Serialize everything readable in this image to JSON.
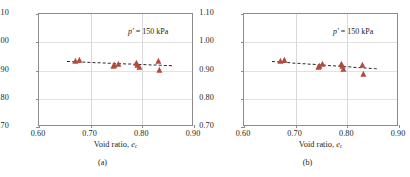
{
  "figure": {
    "marker_color": "#b5493c",
    "trend_color": "#2b2b2b",
    "axis_color": "#8c8c8c",
    "grid_color": "#d9d9d9"
  },
  "panels": [
    {
      "id": "a",
      "caption": "(a)",
      "annotation": "p' = 150 kPa",
      "ylabel_text": "[G0]satur / [G0]D",
      "xlabel_text": "Void ratio, ec",
      "chart_data": {
        "type": "scatter",
        "title": "",
        "xlabel": "Void ratio, e_c",
        "ylabel": "[G_0]_satur / [G_0]_D",
        "xlim": [
          0.6,
          0.9
        ],
        "ylim": [
          0.7,
          1.1
        ],
        "xticks": [
          "0.60",
          "0.70",
          "0.80",
          "0.90"
        ],
        "yticks": [
          "0.70",
          "0.80",
          "0.90",
          "1.00",
          "1.10"
        ],
        "xtick_values": [
          0.6,
          0.7,
          0.8,
          0.9
        ],
        "ytick_values": [
          0.7,
          0.8,
          0.9,
          1.0,
          1.1
        ],
        "grid": true,
        "legend": "none",
        "annotations": [
          {
            "text": "p' = 150 kPa",
            "x": 0.845,
            "y": 1.055
          }
        ],
        "series": [
          {
            "name": "Gmax ratio (saturated / dry)",
            "marker": "triangle",
            "color": "#b5493c",
            "points": [
              {
                "x": 0.672,
                "y": 0.935
              },
              {
                "x": 0.68,
                "y": 0.938
              },
              {
                "x": 0.745,
                "y": 0.915
              },
              {
                "x": 0.748,
                "y": 0.921
              },
              {
                "x": 0.755,
                "y": 0.924
              },
              {
                "x": 0.79,
                "y": 0.928
              },
              {
                "x": 0.792,
                "y": 0.92
              },
              {
                "x": 0.795,
                "y": 0.912
              },
              {
                "x": 0.832,
                "y": 0.933
              },
              {
                "x": 0.834,
                "y": 0.903
              }
            ]
          }
        ],
        "trendline": {
          "style": "dashed",
          "color": "#2b2b2b",
          "x_start": 0.655,
          "y_start": 0.932,
          "x_end": 0.858,
          "y_end": 0.917
        }
      }
    },
    {
      "id": "b",
      "caption": "(b)",
      "annotation": "p' = 150 kPa",
      "ylabel_text": "[G0/F(e)]satur / [G0/F(e)]D",
      "xlabel_text": "Void ratio, ec",
      "chart_data": {
        "type": "scatter",
        "title": "",
        "xlabel": "Void ratio, e_c",
        "ylabel": "[G_0/F(e)]_satur / [G_0/F(e)]_D",
        "xlim": [
          0.6,
          0.9
        ],
        "ylim": [
          0.7,
          1.1
        ],
        "xticks": [
          "0.60",
          "0.70",
          "0.80",
          "0.90"
        ],
        "yticks": [
          "0.70",
          "0.80",
          "0.90",
          "1.00",
          "1.10"
        ],
        "xtick_values": [
          0.6,
          0.7,
          0.8,
          0.9
        ],
        "ytick_values": [
          0.7,
          0.8,
          0.9,
          1.0,
          1.1
        ],
        "grid": true,
        "legend": "none",
        "annotations": [
          {
            "text": "p' = 150 kPa",
            "x": 0.845,
            "y": 1.055
          }
        ],
        "series": [
          {
            "name": "Normalized G0/F(e) ratio (saturated / dry)",
            "marker": "triangle",
            "color": "#b5493c",
            "points": [
              {
                "x": 0.672,
                "y": 0.934
              },
              {
                "x": 0.68,
                "y": 0.936
              },
              {
                "x": 0.745,
                "y": 0.912
              },
              {
                "x": 0.748,
                "y": 0.918
              },
              {
                "x": 0.752,
                "y": 0.922
              },
              {
                "x": 0.79,
                "y": 0.925
              },
              {
                "x": 0.792,
                "y": 0.916
              },
              {
                "x": 0.794,
                "y": 0.906
              },
              {
                "x": 0.83,
                "y": 0.92
              },
              {
                "x": 0.833,
                "y": 0.888
              }
            ]
          }
        ],
        "trendline": {
          "style": "dashed",
          "color": "#2b2b2b",
          "x_start": 0.655,
          "y_start": 0.932,
          "x_end": 0.858,
          "y_end": 0.906
        }
      }
    }
  ]
}
